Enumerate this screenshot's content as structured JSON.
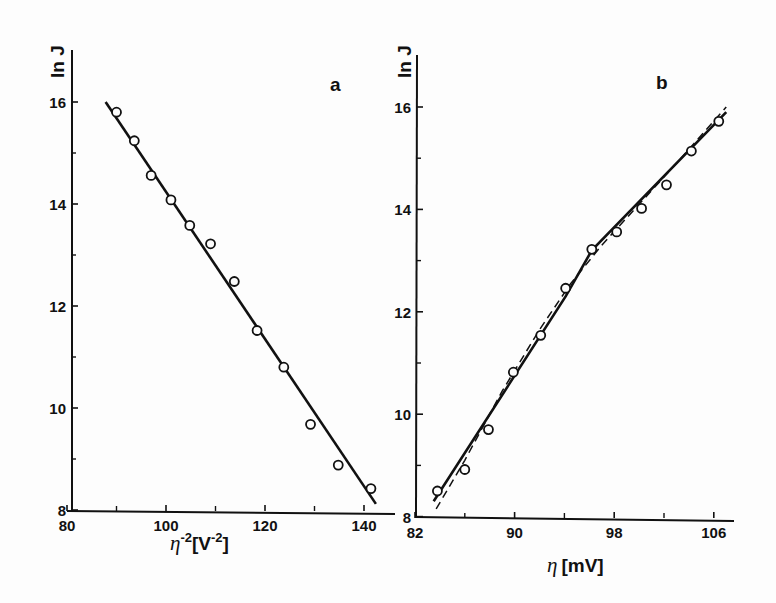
{
  "chart_data": [
    {
      "type": "scatter",
      "panel": "a",
      "panel_label": "a",
      "title": "",
      "xlabel": "η^-2 [V^-2]",
      "ylabel": "ln J",
      "xlim": [
        78,
        146
      ],
      "ylim": [
        8,
        16.8
      ],
      "x_ticks": [
        80,
        100,
        120,
        140
      ],
      "x_minor_ticks": [
        90,
        110,
        130
      ],
      "y_ticks": [
        8,
        10,
        12,
        14,
        16
      ],
      "y_minor_ticks": [
        9,
        11,
        13,
        15
      ],
      "grid": false,
      "series": [
        {
          "name": "data",
          "marker": "open-circle",
          "x": [
            90,
            93.6,
            97,
            101,
            104.8,
            109,
            113.8,
            118.4,
            123.8,
            129.2,
            134.8,
            141.4
          ],
          "y": [
            15.8,
            15.24,
            14.56,
            14.08,
            13.58,
            13.22,
            12.48,
            11.52,
            10.8,
            9.68,
            8.88,
            8.42
          ]
        },
        {
          "name": "linear fit",
          "style": "solid",
          "x": [
            87.8,
            142.4
          ],
          "y": [
            16.0,
            8.12
          ]
        }
      ]
    },
    {
      "type": "scatter",
      "panel": "b",
      "panel_label": "b",
      "title": "",
      "xlabel": "η [mV]",
      "ylabel": "ln J",
      "xlim": [
        82,
        107
      ],
      "ylim": [
        8,
        16.8
      ],
      "x_ticks": [
        82,
        90,
        98,
        106
      ],
      "x_minor_ticks": [
        86,
        94,
        102
      ],
      "y_ticks": [
        8,
        10,
        12,
        14,
        16
      ],
      "y_minor_ticks": [
        9,
        11,
        13,
        15
      ],
      "grid": false,
      "series": [
        {
          "name": "data",
          "marker": "open-circle",
          "x": [
            83.8,
            86,
            87.9,
            89.9,
            92.1,
            94.1,
            96.2,
            98.2,
            100.2,
            102.2,
            104.2,
            106.4
          ],
          "y": [
            8.5,
            8.92,
            9.7,
            10.82,
            11.54,
            12.46,
            13.22,
            13.56,
            14.02,
            14.48,
            15.14,
            15.72
          ]
        },
        {
          "name": "piecewise linear fit",
          "style": "solid",
          "x": [
            83.5,
            94.1,
            96.2,
            107
          ],
          "y": [
            8.3,
            12.3,
            13.2,
            15.9
          ]
        },
        {
          "name": "curved fit",
          "style": "dashed",
          "x": [
            83.7,
            86,
            89,
            92,
            94.5,
            97,
            100,
            103,
            107
          ],
          "y": [
            8.15,
            9.1,
            10.45,
            11.65,
            12.55,
            13.3,
            14.1,
            14.9,
            16.0
          ]
        }
      ]
    }
  ],
  "labels": {
    "panel_a": "a",
    "panel_b": "b",
    "ylabel_a": "ln J",
    "ylabel_b": "ln J",
    "xlabel_a_eta": "η",
    "xlabel_a_exp": "-2",
    "xlabel_a_unit_open": "[V",
    "xlabel_a_unit_exp": "-2",
    "xlabel_a_unit_close": "]",
    "xlabel_b_eta": "η",
    "xlabel_b_unit": "[mV]"
  }
}
